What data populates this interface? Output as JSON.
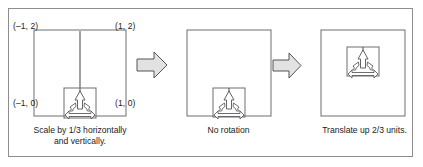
{
  "figure": {
    "background_color": "#ffffff",
    "frame_color": "#8d8d8d",
    "line_color": "#4a4a4a",
    "text_color": "#1b1b1b",
    "arrow_fill": "#e2e2e2",
    "arrow_stroke": "#555555"
  },
  "panels": [
    {
      "id": "panel-1",
      "caption_line_1": "Scale by 1/3 horizontally",
      "caption_line_2": "and vertically.",
      "corner_labels": {
        "top_left": "(–1, 2)",
        "top_right": "(1, 2)",
        "bottom_left": "(–1, 0)",
        "bottom_right": "(1, 0)"
      }
    },
    {
      "id": "panel-2",
      "caption_line_1": "No rotation",
      "caption_line_2": "",
      "corner_labels": {}
    },
    {
      "id": "panel-3",
      "caption_line_1": "Translate up 2/3 units.",
      "caption_line_2": "",
      "corner_labels": {}
    }
  ],
  "arrows": [
    {
      "id": "arrow-1",
      "direction": "right"
    },
    {
      "id": "arrow-2",
      "direction": "right"
    }
  ]
}
